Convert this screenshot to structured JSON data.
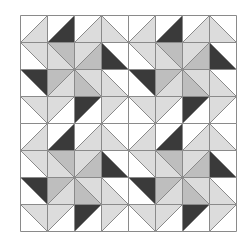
{
  "quilt": {
    "title": "Half-square triangle quilt pattern",
    "grid_size": 8,
    "cell_px": 27,
    "origin": [
      20,
      15
    ],
    "colors": {
      "W": "#ffffff",
      "L": "#dcdcdc",
      "M": "#bebebe",
      "D": "#3a3a3a",
      "line": "#8a8a8a"
    },
    "diagonal_legend": {
      "/": "diagonal bottom-left to top-right; colors [upper-left, lower-right]",
      "\\": "diagonal top-left to bottom-right; colors [lower-left, upper-right]"
    },
    "block_repeat": [
      2,
      2
    ],
    "block": [
      [
        [
          "/",
          "W",
          "L"
        ],
        [
          "/",
          "W",
          "D"
        ],
        [
          "/",
          "W",
          "L"
        ],
        [
          "\\",
          "L",
          "W"
        ]
      ],
      [
        [
          "\\",
          "W",
          "L"
        ],
        [
          "\\",
          "L",
          "M"
        ],
        [
          "/",
          "L",
          "M"
        ],
        [
          "\\",
          "D",
          "W"
        ]
      ],
      [
        [
          "\\",
          "W",
          "D"
        ],
        [
          "/",
          "M",
          "L"
        ],
        [
          "\\",
          "M",
          "L"
        ],
        [
          "\\",
          "L",
          "W"
        ]
      ],
      [
        [
          "\\",
          "W",
          "L"
        ],
        [
          "/",
          "L",
          "W"
        ],
        [
          "/",
          "D",
          "W"
        ],
        [
          "/",
          "L",
          "W"
        ]
      ]
    ]
  }
}
